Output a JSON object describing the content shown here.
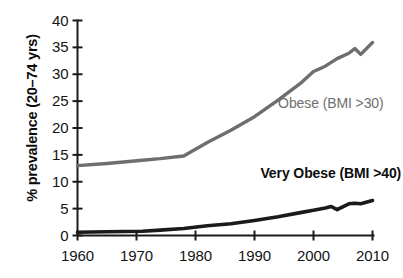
{
  "chart_data": {
    "type": "line",
    "title": "",
    "xlabel": "",
    "ylabel": "% prevalence (20–74 yrs)",
    "xlim": [
      1960,
      2010
    ],
    "ylim": [
      0,
      40
    ],
    "grid": false,
    "legend_position": "inline-annotation",
    "x_ticks": [
      "1960",
      "1970",
      "1980",
      "1990",
      "2000",
      "2010"
    ],
    "x_tick_values": [
      1960,
      1970,
      1980,
      1990,
      2000,
      2010
    ],
    "y_ticks": [
      "0",
      "5",
      "10",
      "15",
      "20",
      "25",
      "30",
      "35",
      "40"
    ],
    "y_tick_values": [
      0,
      5,
      10,
      15,
      20,
      25,
      30,
      35,
      40
    ],
    "series": [
      {
        "name": "Obese (BMI >30)",
        "color": "#6e6e6e",
        "label_color": "#6e6e6e",
        "bold_label": false,
        "x": [
          1960,
          1965,
          1971,
          1974,
          1978,
          1982,
          1986,
          1990,
          1994,
          1998,
          2000,
          2002,
          2004,
          2006,
          2007,
          2008,
          2010
        ],
        "values": [
          13.0,
          13.4,
          14.0,
          14.3,
          14.8,
          17.3,
          19.6,
          22.1,
          25.2,
          28.5,
          30.5,
          31.5,
          32.9,
          33.9,
          34.8,
          33.7,
          35.9
        ]
      },
      {
        "name": "Very Obese (BMI >40)",
        "color": "#1a1a1a",
        "label_color": "#0d0d0d",
        "bold_label": true,
        "x": [
          1960,
          1965,
          1971,
          1974,
          1978,
          1982,
          1986,
          1990,
          1994,
          1998,
          2000,
          2002,
          2003,
          2004,
          2006,
          2007,
          2008,
          2010
        ],
        "values": [
          0.6,
          0.7,
          0.8,
          1.0,
          1.3,
          1.8,
          2.2,
          2.8,
          3.5,
          4.3,
          4.7,
          5.1,
          5.4,
          4.8,
          5.9,
          6.0,
          5.9,
          6.5
        ]
      }
    ],
    "annotations": [
      {
        "text": "Obese (BMI >30)",
        "x": 1994,
        "y": 24.5
      },
      {
        "text": "Very Obese (BMI >40)",
        "x": 1991,
        "y": 11.5
      }
    ]
  }
}
